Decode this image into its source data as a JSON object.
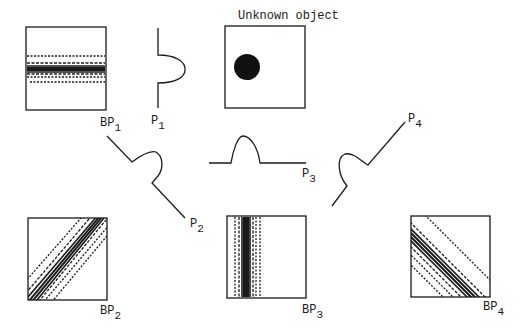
{
  "title": "Unknown object",
  "labels": {
    "bp1": {
      "main": "BP",
      "sub": "1"
    },
    "bp2": {
      "main": "BP",
      "sub": "2"
    },
    "bp3": {
      "main": "BP",
      "sub": "3"
    },
    "bp4": {
      "main": "BP",
      "sub": "4"
    },
    "p1": {
      "main": "P",
      "sub": "1"
    },
    "p2": {
      "main": "P",
      "sub": "2"
    },
    "p3": {
      "main": "P",
      "sub": "3"
    },
    "p4": {
      "main": "P",
      "sub": "4"
    }
  },
  "colors": {
    "ink": "#1a1a1a",
    "background": "#ffffff"
  }
}
